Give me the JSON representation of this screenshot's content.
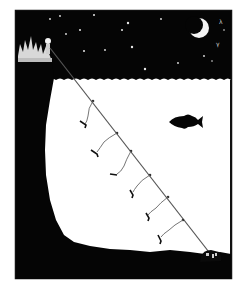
{
  "illustration": {
    "subject": "night fishing longline illustration",
    "colors": {
      "background": "#ffffff",
      "ink": "#050505",
      "water": "#ffffff",
      "line": "#555555",
      "star": "#e8e8e8"
    },
    "elements": {
      "moon": "crescent-moon",
      "stars": "stars",
      "pier": "pier-with-fisherman",
      "line": "longline",
      "hooks": "baited-hooks",
      "fish": "fish",
      "trap": "anchor-trap",
      "seabed": "seabed",
      "cliff": "underwater-cliff"
    },
    "hook_count": 6
  }
}
